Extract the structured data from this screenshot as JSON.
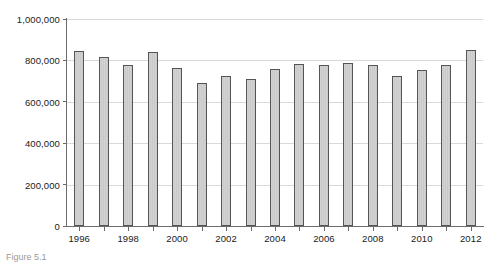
{
  "chart_data": {
    "type": "bar",
    "title": "",
    "xlabel": "",
    "ylabel": "",
    "ylim": [
      0,
      1000000
    ],
    "grid": true,
    "legend": "none",
    "categories": [
      "1996",
      "1997",
      "1998",
      "1999",
      "2000",
      "2001",
      "2002",
      "2003",
      "2004",
      "2005",
      "2006",
      "2007",
      "2008",
      "2009",
      "2010",
      "2011",
      "2012"
    ],
    "values": [
      845000,
      815000,
      778000,
      840000,
      765000,
      690000,
      723000,
      710000,
      757000,
      785000,
      778000,
      787000,
      777000,
      725000,
      755000,
      780000,
      850000
    ],
    "y_ticks": [
      0,
      200000,
      400000,
      600000,
      800000,
      1000000
    ],
    "y_tick_labels": [
      "0",
      "200,000",
      "400,000",
      "600,000",
      "800,000",
      "1,000,000"
    ],
    "x_tick_labels_shown": [
      "1996",
      "1998",
      "2000",
      "2002",
      "2004",
      "2006",
      "2008",
      "2010",
      "2012"
    ],
    "colors": {
      "bar_fill": "#d2d2d2",
      "bar_border": "#555555",
      "gridline": "#d9d9d9",
      "axis": "#6b6b6b",
      "text": "#1a1a1a",
      "background": "#ffffff"
    }
  },
  "caption": {
    "text": "Figure 5.1"
  }
}
